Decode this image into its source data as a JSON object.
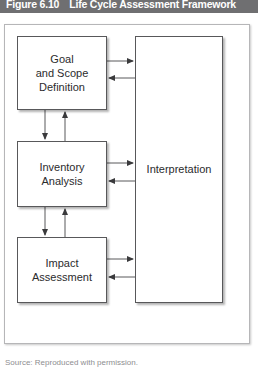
{
  "figure": {
    "number": "Figure 6.10",
    "title": "Life Cycle Assessment Framework",
    "header_bg": "#6f6f71",
    "header_text_color": "#ffffff"
  },
  "diagram": {
    "type": "flow-diagram",
    "frame_border_color": "#b6b6b8",
    "node_border_color": "#58585a",
    "node_fill": "#ffffff",
    "connector_color": "#58585a",
    "nodes": [
      {
        "id": "goal",
        "label": "Goal\nand Scope\nDefinition",
        "line1": "Goal",
        "line2": "and Scope",
        "line3": "Definition"
      },
      {
        "id": "inventory",
        "label": "Inventory\nAnalysis",
        "line1": "Inventory",
        "line2": "Analysis",
        "line3": ""
      },
      {
        "id": "impact",
        "label": "Impact\nAssessment",
        "line1": "Impact",
        "line2": "Assessment",
        "line3": ""
      },
      {
        "id": "interpretation",
        "label": "Interpretation",
        "line1": "Interpretation",
        "line2": "",
        "line3": ""
      }
    ],
    "connections": [
      {
        "from": "goal",
        "to": "interpretation",
        "direction": "right"
      },
      {
        "from": "interpretation",
        "to": "goal",
        "direction": "left"
      },
      {
        "from": "inventory",
        "to": "interpretation",
        "direction": "right"
      },
      {
        "from": "interpretation",
        "to": "inventory",
        "direction": "left"
      },
      {
        "from": "impact",
        "to": "interpretation",
        "direction": "right"
      },
      {
        "from": "interpretation",
        "to": "impact",
        "direction": "left"
      },
      {
        "from": "goal",
        "to": "inventory",
        "direction": "down"
      },
      {
        "from": "inventory",
        "to": "goal",
        "direction": "up"
      },
      {
        "from": "inventory",
        "to": "impact",
        "direction": "down"
      },
      {
        "from": "impact",
        "to": "inventory",
        "direction": "up"
      }
    ]
  },
  "source": {
    "text": "Source: Reproduced with permission."
  }
}
